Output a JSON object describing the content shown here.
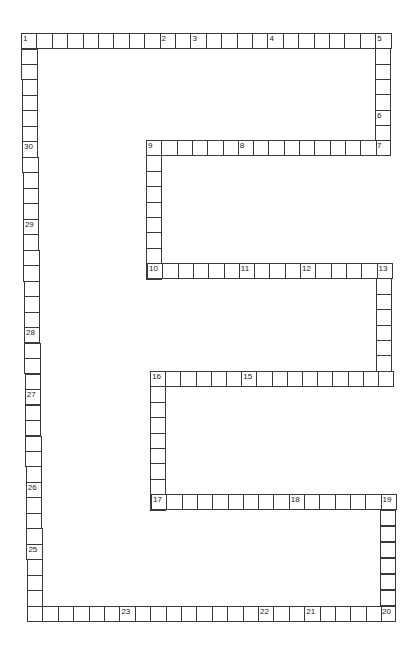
{
  "puzzle": {
    "title": "",
    "colors": {
      "line": "#3a3a3a",
      "background": "#ffffff",
      "number": "#222222"
    },
    "cell_size": 15.4,
    "segments": [
      {
        "name": "top-row",
        "dir": "h",
        "x": 21,
        "y": 33,
        "count": 24,
        "step": 15.4,
        "numbers": {
          "0": "1",
          "9": "2",
          "11": "3",
          "16": "4",
          "23": "5"
        }
      },
      {
        "name": "right-col-top",
        "dir": "v",
        "x": 375,
        "y": 33,
        "count": 8,
        "step": 15.3,
        "numbers": {
          "5": "6",
          "7": "7"
        }
      },
      {
        "name": "row-9",
        "dir": "h",
        "x": 146,
        "y": 140,
        "count": 16,
        "step": 15.3,
        "numbers": {
          "0": "9",
          "6": "8"
        }
      },
      {
        "name": "col-9-10",
        "dir": "v",
        "x": 146,
        "y": 140,
        "count": 9,
        "step": 15.4,
        "numbers": {}
      },
      {
        "name": "row-10",
        "dir": "h",
        "x": 147,
        "y": 263,
        "count": 16,
        "step": 15.3,
        "numbers": {
          "0": "10",
          "6": "11",
          "10": "12",
          "15": "13"
        }
      },
      {
        "name": "col-13-14",
        "dir": "v",
        "x": 376,
        "y": 263,
        "count": 8,
        "step": 15.4,
        "numbers": {
          "7": "14"
        }
      },
      {
        "name": "row-16",
        "dir": "h",
        "x": 150,
        "y": 371,
        "count": 16,
        "step": 15.2,
        "numbers": {
          "0": "16",
          "6": "15"
        }
      },
      {
        "name": "col-16-17",
        "dir": "v",
        "x": 150,
        "y": 371,
        "count": 9,
        "step": 15.4,
        "numbers": {}
      },
      {
        "name": "row-17",
        "dir": "h",
        "x": 151,
        "y": 494,
        "count": 16,
        "step": 15.3,
        "numbers": {
          "0": "17",
          "9": "18",
          "15": "19"
        }
      },
      {
        "name": "col-19-20",
        "dir": "v",
        "x": 380,
        "y": 494,
        "count": 8,
        "step": 16.0,
        "numbers": {
          "7": "20"
        }
      },
      {
        "name": "bottom-row",
        "dir": "h",
        "x": 27,
        "y": 606,
        "count": 24,
        "step": 15.4,
        "numbers": {
          "0": "24",
          "6": "23",
          "15": "22",
          "18": "21"
        }
      },
      {
        "name": "left-col",
        "dir": "v",
        "x": 21,
        "y": 33,
        "count": 38,
        "step": 15.48,
        "xdrift": 6,
        "numbers": {
          "7": "30",
          "12": "29",
          "19": "28",
          "23": "27",
          "29": "26",
          "33": "25"
        }
      }
    ]
  }
}
